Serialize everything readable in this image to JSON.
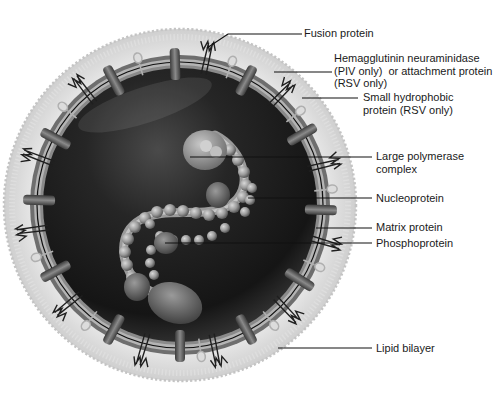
{
  "figure": {
    "colors": {
      "background": "#ffffff",
      "bilayer": "#d6d6d6",
      "core_dark": "#1b1b1b",
      "matrix_ring": "#8a8a8a",
      "leader_line": "#111111",
      "label_text": "#1a1a1a"
    }
  },
  "labels": [
    {
      "id": "fusion-protein",
      "text": "Fusion protein"
    },
    {
      "id": "hemagglutinin-neuraminidase",
      "text": "Hemagglutinin neuraminidase\n(PIV only)  or attachment protein\n(RSV only)"
    },
    {
      "id": "small-hydrophobic-protein",
      "text": "Small hydrophobic\nprotein (RSV only)"
    },
    {
      "id": "large-polymerase-complex",
      "text": "Large polymerase\ncomplex"
    },
    {
      "id": "nucleoprotein",
      "text": "Nucleoprotein"
    },
    {
      "id": "matrix-protein",
      "text": "Matrix protein"
    },
    {
      "id": "phosphoprotein",
      "text": "Phosphoprotein"
    },
    {
      "id": "lipid-bilayer",
      "text": "Lipid bilayer"
    }
  ]
}
